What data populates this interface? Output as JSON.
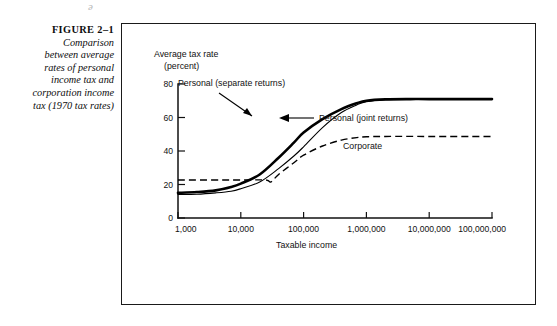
{
  "artifact": {
    "mark": "ə"
  },
  "caption": {
    "figure_label": "FIGURE 2–1",
    "line1": "Comparison",
    "line2": "between average",
    "line3": "rates of personal",
    "line4": "income tax and",
    "line5": "corporation income",
    "line6": "tax (1970 tax rates)"
  },
  "chart_data": {
    "type": "line",
    "title": "",
    "xlabel": "Taxable income",
    "ylabel": "Average tax rate",
    "ylabel_unit": "(percent)",
    "xscale": "log",
    "xlim": [
      1000,
      100000000
    ],
    "ylim": [
      0,
      80
    ],
    "grid": false,
    "legend_position": "inline-annotations",
    "xticks": [
      {
        "value": 1000,
        "label": "1,000"
      },
      {
        "value": 10000,
        "label": "10,000"
      },
      {
        "value": 100000,
        "label": "100,000"
      },
      {
        "value": 1000000,
        "label": "1,000,000"
      },
      {
        "value": 10000000,
        "label": "10,000,000"
      },
      {
        "value": 100000000,
        "label": "100,000,000"
      }
    ],
    "yticks": [
      {
        "value": 0,
        "label": "0"
      },
      {
        "value": 20,
        "label": "20"
      },
      {
        "value": 40,
        "label": "40"
      },
      {
        "value": 60,
        "label": "60"
      },
      {
        "value": 80,
        "label": "80"
      }
    ],
    "series": [
      {
        "name": "Personal (separate returns)",
        "style": "solid-thick",
        "x": [
          1000,
          2000,
          4000,
          7000,
          10000,
          20000,
          40000,
          70000,
          100000,
          200000,
          400000,
          700000,
          1000000,
          2000000,
          5000000,
          10000000,
          100000000
        ],
        "values": [
          15,
          15.5,
          16.5,
          18.5,
          20.5,
          26,
          36,
          45,
          51,
          59,
          65,
          68.5,
          70,
          70.8,
          71,
          71,
          71
        ]
      },
      {
        "name": "Personal (joint returns)",
        "style": "solid-thin",
        "x": [
          1000,
          2000,
          4000,
          7000,
          10000,
          20000,
          40000,
          70000,
          100000,
          200000,
          400000,
          700000,
          1000000,
          2000000,
          5000000,
          10000000,
          100000000
        ],
        "values": [
          14,
          14.2,
          15,
          16,
          17.5,
          21.5,
          29.5,
          37,
          42.5,
          54,
          63,
          67.5,
          69.5,
          70.7,
          71,
          71,
          71
        ]
      },
      {
        "name": "Corporate",
        "style": "dashed",
        "x": [
          1000,
          10000,
          25000,
          30000,
          40000,
          70000,
          100000,
          200000,
          400000,
          700000,
          1000000,
          2000000,
          10000000,
          100000000
        ],
        "values": [
          22.7,
          22.7,
          22.7,
          21.5,
          26,
          33,
          37.5,
          43,
          46.5,
          48,
          48.5,
          48.7,
          48.7,
          48.7
        ]
      }
    ],
    "annotations": [
      {
        "text": "Personal (separate returns)",
        "target_series": "Personal (separate returns)",
        "arrow": "down-right"
      },
      {
        "text": "Personal (joint returns)",
        "target_series": "Personal (joint returns)",
        "arrow": "left"
      },
      {
        "text": "Corporate",
        "target_series": "Corporate",
        "arrow": "none"
      }
    ]
  }
}
